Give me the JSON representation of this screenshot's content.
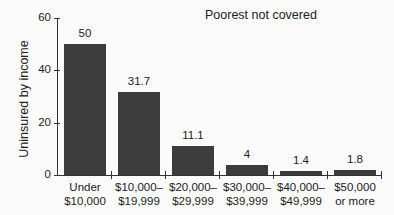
{
  "chart_data": {
    "type": "bar",
    "title": "Poorest not covered",
    "xlabel": "",
    "ylabel": "Uninsured by income",
    "ylim": [
      0,
      60
    ],
    "yticks": [
      0,
      20,
      40,
      60
    ],
    "grid": false,
    "categories": [
      [
        "Under",
        "$10,000"
      ],
      [
        "$10,000–",
        "$19,999"
      ],
      [
        "$20,000–",
        "$29,999"
      ],
      [
        "$30,000–",
        "$39,999"
      ],
      [
        "$40,000–",
        "$49,999"
      ],
      [
        "$50,000",
        "or more"
      ]
    ],
    "values": [
      50,
      31.7,
      11.1,
      4,
      1.4,
      1.8
    ],
    "value_labels": [
      "50",
      "31.7",
      "11.1",
      "4",
      "1.4",
      "1.8"
    ],
    "bar_color": "#3c3c3c"
  }
}
